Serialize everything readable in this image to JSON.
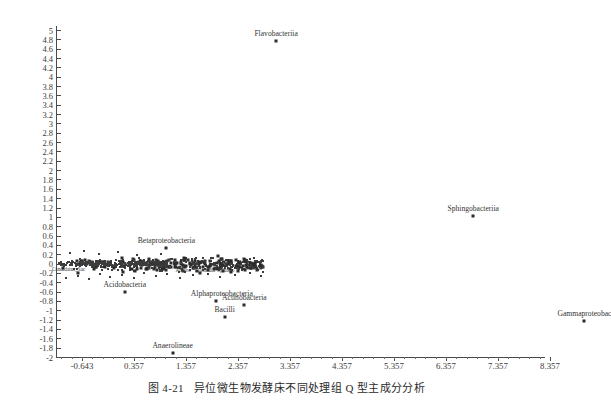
{
  "caption": {
    "number": "图 4-21",
    "text": "异位微生物发酵床不同处理组 Q 型主成分分析"
  },
  "chart_data": {
    "type": "scatter",
    "title": "",
    "xlabel": "",
    "ylabel": "",
    "xlim": [
      -1.143,
      8.9
    ],
    "ylim": [
      -2,
      5
    ],
    "grid": false,
    "legend": "none",
    "xticks": [
      "-0.643",
      "0.357",
      "1.357",
      "2.357",
      "3.357",
      "4.357",
      "5.357",
      "6.357",
      "7.357",
      "8.357"
    ],
    "xtick_values": [
      -0.643,
      0.357,
      1.357,
      2.357,
      3.357,
      4.357,
      5.357,
      6.357,
      7.357,
      8.357
    ],
    "yticks": [
      "5",
      "4.8",
      "4.6",
      "4.4",
      "4.2",
      "4",
      "3.8",
      "3.6",
      "3.4",
      "3.2",
      "3",
      "2.8",
      "2.6",
      "2.4",
      "2.2",
      "2",
      "1.8",
      "1.6",
      "1.4",
      "1.2",
      "1",
      "0.8",
      "0.6",
      "0.4",
      "0.2",
      "0",
      "-0.2",
      "-0.4",
      "-0.6",
      "-0.8",
      "-1",
      "-1.2",
      "-1.4",
      "-1.6",
      "-1.8",
      "-2"
    ],
    "ytick_values": [
      5,
      4.8,
      4.6,
      4.4,
      4.2,
      4,
      3.8,
      3.6,
      3.4,
      3.2,
      3,
      2.8,
      2.6,
      2.4,
      2.2,
      2,
      1.8,
      1.6,
      1.4,
      1.2,
      1,
      0.8,
      0.6,
      0.4,
      0.2,
      0,
      -0.2,
      -0.4,
      -0.6,
      -0.8,
      -1,
      -1.2,
      -1.4,
      -1.6,
      -1.8,
      -2
    ],
    "labeled_points": [
      {
        "name": "Flavobacteriia",
        "x": 3.09,
        "y": 4.76,
        "label_dx": 0,
        "label_dy": -11
      },
      {
        "name": "Sphingobacteriia",
        "x": 6.88,
        "y": 1.02,
        "label_dx": 0,
        "label_dy": -11
      },
      {
        "name": "Gammaproteobac",
        "x": 9.02,
        "y": -1.22,
        "label_dx": 0,
        "label_dy": -11
      },
      {
        "name": "Betaproteobacteria",
        "x": 0.98,
        "y": 0.33,
        "label_dx": 0,
        "label_dy": -11
      },
      {
        "name": "Acidobacteria",
        "x": 0.18,
        "y": -0.6,
        "label_dx": 0,
        "label_dy": -11
      },
      {
        "name": "Alphaproteobacteria",
        "x": 1.93,
        "y": -0.81,
        "label_dx": 6,
        "label_dy": -11
      },
      {
        "name": "Actinobacteria",
        "x": 2.48,
        "y": -0.88,
        "label_dx": 0,
        "label_dy": -11
      },
      {
        "name": "Bacilli",
        "x": 2.1,
        "y": -1.15,
        "label_dx": 0,
        "label_dy": -11
      },
      {
        "name": "Anaerolineae",
        "x": 1.1,
        "y": -1.91,
        "label_dx": 0,
        "label_dy": -11
      }
    ],
    "cluster_labels": [
      {
        "name": "Clostridia",
        "x": 2.62,
        "y": -0.13
      },
      {
        "name": "Clostridia",
        "x": 1.72,
        "y": -0.18
      },
      {
        "name": "Candidatus_Sac",
        "x": -0.9,
        "y": -0.16
      },
      {
        "name": "bacteria",
        "x": 0.8,
        "y": -0.02
      },
      {
        "name": "Sphingo",
        "x": 2.12,
        "y": -0.17
      },
      {
        "name": "Anaero",
        "x": 1.3,
        "y": -0.19
      }
    ],
    "cluster_description": "Dense overlapping mass of unlabeled scatter points concentrated near y = 0 spanning x = -1.1 to 2.8",
    "cluster_count": 420
  }
}
